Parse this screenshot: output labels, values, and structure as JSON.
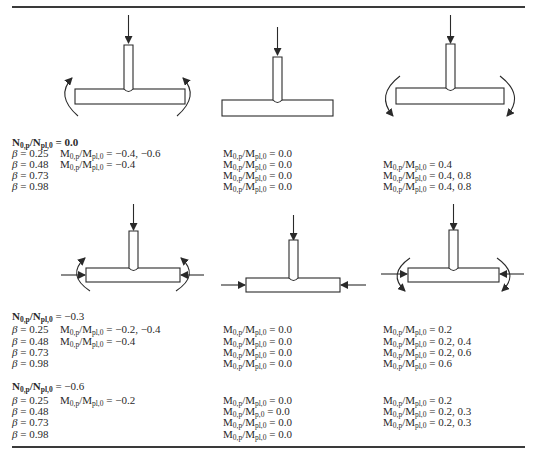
{
  "figure": {
    "top_diagrams": [
      {
        "id": "axial-moment-opening",
        "loads": [
          "brace-axial-compression",
          "chord-moment-opening"
        ]
      },
      {
        "id": "axial-only",
        "loads": [
          "brace-axial-compression"
        ]
      },
      {
        "id": "axial-moment-closing",
        "loads": [
          "brace-axial-compression",
          "chord-moment-closing"
        ]
      }
    ],
    "bottom_diagrams": [
      {
        "id": "axial-chord-compression-moment-opening",
        "loads": [
          "brace-axial-compression",
          "chord-axial-compression",
          "chord-moment-opening"
        ]
      },
      {
        "id": "axial-chord-compression",
        "loads": [
          "brace-axial-compression",
          "chord-axial-compression"
        ]
      },
      {
        "id": "axial-chord-compression-moment-closing",
        "loads": [
          "brace-axial-compression",
          "chord-axial-compression",
          "chord-moment-closing"
        ]
      }
    ]
  },
  "label": {
    "n_lhs": "N",
    "n_sub_lhs": "0,p",
    "n_slash": "/N",
    "n_sub_rhs": "pl,0",
    "m_lhs": "M",
    "m_sub_lhs": "0,p",
    "m_slash": "/M",
    "m_sub_rhs": "pl,0",
    "m_sub_rhs_typo": "p,0",
    "beta": "β"
  },
  "sections": [
    {
      "n_value": " = 0.0",
      "rows": [
        {
          "beta": " = 0.25",
          "col1": " = −0.4, −0.6",
          "col2": " = 0.0",
          "col3": null
        },
        {
          "beta": " = 0.48",
          "col1": " = −0.4",
          "col2": " = 0.0",
          "col3": " = 0.4"
        },
        {
          "beta": " = 0.73",
          "col1": null,
          "col2": " = 0.0",
          "col3": " = 0.4, 0.8"
        },
        {
          "beta": " = 0.98",
          "col1": null,
          "col2": " = 0.0",
          "col3": " = 0.4, 0.8"
        }
      ]
    },
    {
      "n_value": " = −0.3",
      "rows": [
        {
          "beta": " = 0.25",
          "col1": " = −0.2, −0.4",
          "col2": " = 0.0",
          "col3": " = 0.2"
        },
        {
          "beta": " = 0.48",
          "col1": " = −0.4",
          "col2": " = 0.0",
          "col3": " = 0.2, 0.4"
        },
        {
          "beta": " = 0.73",
          "col1": null,
          "col2": " = 0.0",
          "col3": " = 0.2, 0.6"
        },
        {
          "beta": " = 0.98",
          "col1": null,
          "col2": " = 0.0",
          "col3": " = 0.6"
        }
      ]
    },
    {
      "n_value": " = −0.6",
      "rows": [
        {
          "beta": " = 0.25",
          "col1": " = −0.2",
          "col2": " = 0.0",
          "col3": " = 0.2"
        },
        {
          "beta": " = 0.48",
          "col1": null,
          "col2": " = 0.0",
          "col3": " = 0.2, 0.3"
        },
        {
          "beta": " = 0.73",
          "col1": null,
          "col2": " = 0.0",
          "col3": " = 0.2, 0.3"
        },
        {
          "beta": " = 0.98",
          "col1": null,
          "col2": " = 0.0",
          "col3": null
        }
      ]
    }
  ]
}
